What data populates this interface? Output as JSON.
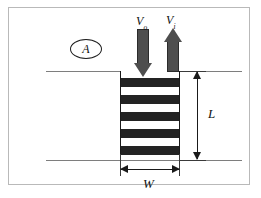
{
  "figure": {
    "caption_present": false,
    "background_color": "#ffffff",
    "frame_color": "#b9b9b9"
  },
  "labels": {
    "velocity_out": {
      "base": "V",
      "sub": "o",
      "full": "Vo"
    },
    "velocity_in": {
      "base": "V",
      "sub": "i",
      "full": "Vi"
    },
    "area_callout": "A",
    "length": "L",
    "width": "W"
  },
  "elements": {
    "slab": {
      "name": "striped-slab",
      "stripe_color": "#232323",
      "gap_color": "#ffffff",
      "edge_color": "#1a1a1a",
      "dark_stripe_count": 5
    },
    "arrow_down": {
      "name": "inflow-arrow",
      "direction": "down",
      "fill_color": "#4e4e4e",
      "outline_color": "#2b2b2b",
      "label_ref": "velocity_out"
    },
    "arrow_up": {
      "name": "outflow-arrow",
      "direction": "up",
      "fill_color": "#4e4e4e",
      "outline_color": "#2b2b2b",
      "label_ref": "velocity_in"
    },
    "dimension_length": {
      "name": "length-dimension",
      "orientation": "vertical",
      "label_ref": "length",
      "color": "#1a1a1a"
    },
    "dimension_width": {
      "name": "width-dimension",
      "orientation": "horizontal",
      "label_ref": "width",
      "color": "#1a1a1a"
    },
    "boundary_lines": {
      "name": "boundary-line",
      "color": "#7e7e7e",
      "count": 2
    }
  }
}
